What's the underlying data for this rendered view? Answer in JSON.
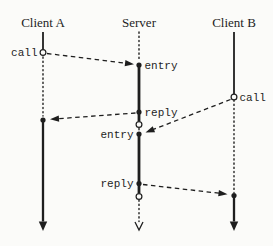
{
  "diagram": {
    "kind": "sequence-diagram",
    "colors": {
      "background": "#fbfbf9",
      "ink": "#1e1e1e"
    },
    "fonts": {
      "actor_size": 13,
      "label_size": 11
    },
    "actors": [
      {
        "id": "client-a",
        "label": "Client A",
        "x": 43,
        "label_baseline_y": 27
      },
      {
        "id": "server",
        "label": "Server",
        "x": 139,
        "label_baseline_y": 27
      },
      {
        "id": "client-b",
        "label": "Client B",
        "x": 234,
        "label_baseline_y": 27
      }
    ],
    "lifeline_segments": [
      {
        "name": "client-a-active-top",
        "actor": "client-a",
        "y1": 32,
        "y2": 49.5,
        "style": "solid",
        "width": 1.8
      },
      {
        "name": "client-a-idle",
        "actor": "client-a",
        "y1": 57,
        "y2": 116,
        "style": "dotted",
        "width": 1.4
      },
      {
        "name": "client-a-active-bottom",
        "actor": "client-a",
        "y1": 120,
        "y2": 221.5,
        "style": "solid",
        "width": 2.3
      },
      {
        "name": "server-idle-top",
        "actor": "server",
        "y1": 32,
        "y2": 61,
        "style": "dotted",
        "width": 1.4
      },
      {
        "name": "server-activation-1",
        "actor": "server",
        "y1": 65,
        "y2": 121,
        "style": "solid",
        "width": 2.8
      },
      {
        "name": "server-idle-middle",
        "actor": "server",
        "y1": 128.5,
        "y2": 131,
        "style": "dotted",
        "width": 1.4
      },
      {
        "name": "server-activation-2",
        "actor": "server",
        "y1": 134,
        "y2": 193,
        "style": "solid",
        "width": 2.8
      },
      {
        "name": "server-idle-bottom",
        "actor": "server",
        "y1": 200,
        "y2": 221.5,
        "style": "dotted",
        "width": 1.4
      },
      {
        "name": "client-b-active-top",
        "actor": "client-b",
        "y1": 32,
        "y2": 94,
        "style": "solid",
        "width": 1.8
      },
      {
        "name": "client-b-idle",
        "actor": "client-b",
        "y1": 100,
        "y2": 192.5,
        "style": "dotted",
        "width": 1.4
      },
      {
        "name": "client-b-active-bottom",
        "actor": "client-b",
        "y1": 195.5,
        "y2": 221.5,
        "style": "solid",
        "width": 2.3
      }
    ],
    "nodes": [
      {
        "name": "call-point-client-a",
        "actor": "client-a",
        "y": 52.5,
        "kind": "open-circle",
        "label": "call",
        "side": "left"
      },
      {
        "name": "entry-point-1",
        "actor": "server",
        "y": 65,
        "kind": "dot",
        "label": "entry",
        "side": "right"
      },
      {
        "name": "reply-point-1",
        "actor": "server",
        "y": 112,
        "kind": "dot",
        "label": "reply",
        "side": "right"
      },
      {
        "name": "return-point-1",
        "actor": "server",
        "y": 124.5,
        "kind": "open-circle",
        "label": "",
        "side": "right"
      },
      {
        "name": "entry-point-2",
        "actor": "server",
        "y": 134,
        "kind": "dot",
        "label": "entry",
        "side": "left"
      },
      {
        "name": "call-point-client-b",
        "actor": "client-b",
        "y": 97,
        "kind": "open-circle",
        "label": "call",
        "side": "right"
      },
      {
        "name": "reply-point-2",
        "actor": "server",
        "y": 183.5,
        "kind": "dot",
        "label": "reply",
        "side": "left"
      },
      {
        "name": "return-point-2",
        "actor": "server",
        "y": 196.5,
        "kind": "open-circle",
        "label": "",
        "side": "right"
      },
      {
        "name": "reply-receive-client-a",
        "actor": "client-a",
        "y": 120,
        "kind": "dot",
        "label": "",
        "side": "left"
      },
      {
        "name": "reply-receive-client-b",
        "actor": "client-b",
        "y": 195.5,
        "kind": "dot",
        "label": "",
        "side": "right"
      }
    ],
    "messages": [
      {
        "name": "message-call-a-to-server",
        "x1": 47,
        "y1": 53.5,
        "x2": 134,
        "y2": 64.2
      },
      {
        "name": "message-reply-server-to-a",
        "x1": 135.5,
        "y1": 113,
        "x2": 50,
        "y2": 119.3
      },
      {
        "name": "message-call-b-to-server",
        "x1": 230.5,
        "y1": 99.5,
        "x2": 145.5,
        "y2": 132.5
      },
      {
        "name": "message-reply-server-to-b",
        "x1": 143,
        "y1": 184.5,
        "x2": 227.5,
        "y2": 194.2
      }
    ],
    "terminals": [
      {
        "name": "client-a-end-arrow",
        "actor": "client-a",
        "tip_y": 231,
        "kind": "filled"
      },
      {
        "name": "server-end-arrow",
        "actor": "server",
        "tip_y": 230,
        "kind": "open"
      },
      {
        "name": "client-b-end-arrow",
        "actor": "client-b",
        "tip_y": 231,
        "kind": "filled"
      }
    ]
  }
}
